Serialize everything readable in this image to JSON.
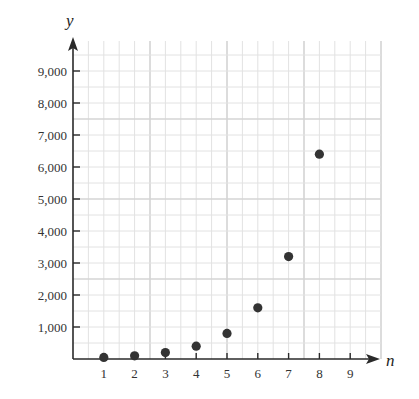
{
  "chart_data": {
    "type": "scatter",
    "title": "",
    "xlabel": "n",
    "ylabel": "y",
    "x": [
      1,
      2,
      3,
      4,
      5,
      6,
      7,
      8
    ],
    "series": [
      {
        "name": "y",
        "values": [
          50,
          100,
          200,
          400,
          800,
          1600,
          3200,
          6400
        ]
      }
    ],
    "x_ticks": [
      1,
      2,
      3,
      4,
      5,
      6,
      7,
      8,
      9
    ],
    "x_tick_labels": [
      "1",
      "2",
      "3",
      "4",
      "5",
      "6",
      "7",
      "8",
      "9"
    ],
    "y_ticks": [
      1000,
      2000,
      3000,
      4000,
      5000,
      6000,
      7000,
      8000,
      9000
    ],
    "y_tick_labels": [
      "1,000",
      "2,000",
      "3,000",
      "4,000",
      "5,000",
      "6,000",
      "7,000",
      "8,000",
      "9,000"
    ],
    "xlim": [
      0,
      10
    ],
    "ylim": [
      0,
      10000
    ],
    "grid": true,
    "grid_minor_step": {
      "x": 0.5,
      "y": 500
    },
    "grid_major_step": {
      "x": 2.5,
      "y": 2500
    },
    "legend": null,
    "colors": {
      "point": "#333333",
      "axis": "#2a2a2a",
      "grid_minor": "#e2e2e2",
      "grid_major": "#d4d4d4"
    }
  }
}
